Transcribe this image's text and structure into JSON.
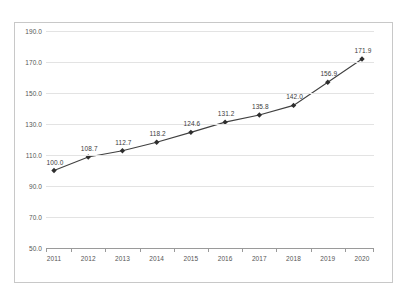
{
  "chart_data": {
    "type": "line",
    "title": "",
    "xlabel": "",
    "ylabel": "",
    "categories": [
      "2011",
      "2012",
      "2013",
      "2014",
      "2015",
      "2016",
      "2017",
      "2018",
      "2019",
      "2020"
    ],
    "values": [
      100.0,
      108.7,
      112.7,
      118.2,
      124.6,
      131.2,
      135.8,
      142.0,
      156.9,
      171.9
    ],
    "point_labels": [
      "100.0",
      "108.7",
      "112.7",
      "118.2",
      "124.6",
      "131.2",
      "135.8",
      "142.0",
      "156.9",
      "171.9"
    ],
    "ylim": [
      50.0,
      190.0
    ],
    "ytick_values": [
      190.0,
      170.0,
      150.0,
      130.0,
      110.0,
      90.0,
      70.0,
      50.0
    ],
    "ytick_labels": [
      "190.0",
      "170.0",
      "150.0",
      "130.0",
      "110.0",
      "90.0",
      "70.0",
      "50.0"
    ],
    "grid": true,
    "legend": "none",
    "series_color": "#404040",
    "marker_color": "#2e2e2e",
    "gridline_color": "#e3e3e3",
    "axis_color": "#9a9a9a",
    "frame_color": "#c8c8c8",
    "label_color": "#555555"
  }
}
